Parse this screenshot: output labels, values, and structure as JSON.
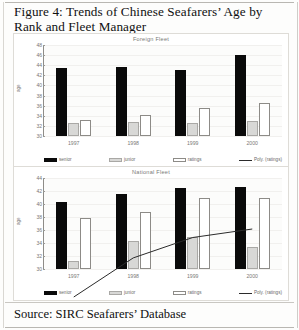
{
  "figure": {
    "title": "Figure 4: Trends of Chinese Seafarers’ Age by Rank and Fleet Manager",
    "source": "Source: SIRC Seafarers’ Database"
  },
  "legend": {
    "senior": "senior",
    "junior": "junior",
    "ratings": "ratings",
    "trend": "Poly. (ratings)"
  },
  "colors": {
    "senior": "#0a0a0a",
    "junior": "#d8d8d6",
    "ratings": "#ffffff",
    "trend": "#2b2b2b",
    "axis": "#8e8c88"
  },
  "chart_data": [
    {
      "id": "foreign",
      "type": "bar",
      "title": "Foreign Fleet",
      "xlabel": "",
      "ylabel": "age",
      "categories": [
        "1997",
        "1998",
        "1999",
        "2000"
      ],
      "ylim": [
        30,
        48
      ],
      "yticks": [
        48,
        46,
        44,
        42,
        40,
        38,
        36,
        34,
        32,
        30
      ],
      "grid": false,
      "legend_position": "bottom",
      "series": [
        {
          "name": "senior",
          "values": [
            43.5,
            43.6,
            43.0,
            46.0
          ]
        },
        {
          "name": "junior",
          "values": [
            32.5,
            32.8,
            32.5,
            33.0
          ]
        },
        {
          "name": "ratings",
          "values": [
            33.2,
            34.2,
            35.5,
            36.5
          ]
        }
      ],
      "trendline": {
        "name": "Poly. (ratings)",
        "values": [
          32.9,
          34.4,
          36.4,
          38.6
        ]
      }
    },
    {
      "id": "national",
      "type": "bar",
      "title": "National Fleet",
      "xlabel": "",
      "ylabel": "age",
      "categories": [
        "1997",
        "1998",
        "1999",
        "2000"
      ],
      "ylim": [
        30,
        44
      ],
      "yticks": [
        44,
        42,
        40,
        38,
        36,
        34,
        32,
        30
      ],
      "grid": false,
      "legend_position": "bottom",
      "series": [
        {
          "name": "senior",
          "values": [
            40.3,
            41.6,
            42.5,
            42.6
          ]
        },
        {
          "name": "junior",
          "values": [
            31.3,
            34.3,
            34.9,
            33.4
          ]
        },
        {
          "name": "ratings",
          "values": [
            37.8,
            38.7,
            41.0,
            41.0
          ]
        }
      ],
      "trendline": {
        "name": "Poly. (ratings)",
        "values": [
          37.0,
          39.3,
          40.5,
          41.0
        ]
      }
    }
  ]
}
